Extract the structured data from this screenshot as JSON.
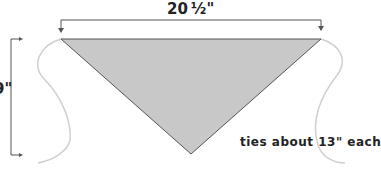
{
  "diagram": {
    "top_dimension": "20 ½\"",
    "side_dimension": "9\"",
    "ties_note": "ties about 13\" each",
    "colors": {
      "triangle_fill": "#c8c8c8",
      "triangle_stroke": "#555555",
      "tie_stroke": "#cfcfcf",
      "dimension_line": "#555555",
      "text": "#222222"
    }
  }
}
